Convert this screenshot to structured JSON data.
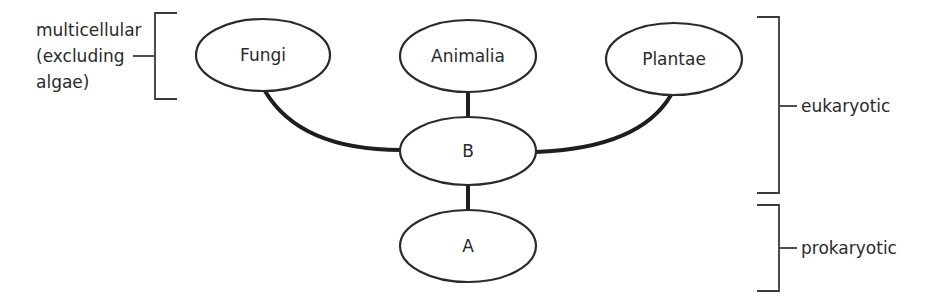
{
  "diagram": {
    "type": "tree",
    "nodes": [
      {
        "id": "fungi",
        "label": "Fungi"
      },
      {
        "id": "animalia",
        "label": "Animalia"
      },
      {
        "id": "plantae",
        "label": "Plantae"
      },
      {
        "id": "b",
        "label": "B"
      },
      {
        "id": "a",
        "label": "A"
      }
    ],
    "edges": [
      {
        "from": "a",
        "to": "b"
      },
      {
        "from": "b",
        "to": "fungi"
      },
      {
        "from": "b",
        "to": "animalia"
      },
      {
        "from": "b",
        "to": "plantae"
      }
    ],
    "annotations": {
      "multicellular": {
        "lines": [
          "multicellular",
          "(excluding",
          "algae)"
        ],
        "applies_to": [
          "fungi"
        ]
      },
      "eukaryotic": {
        "label": "eukaryotic",
        "applies_to": [
          "fungi",
          "animalia",
          "plantae",
          "b"
        ]
      },
      "prokaryotic": {
        "label": "prokaryotic",
        "applies_to": [
          "a"
        ]
      }
    }
  }
}
